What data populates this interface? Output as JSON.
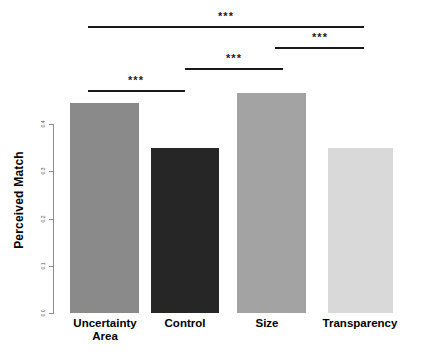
{
  "chart_data": {
    "type": "bar",
    "title": "",
    "xlabel": "",
    "ylabel": "Perceived Match",
    "categories": [
      "Uncertainty Area",
      "Control",
      "Size",
      "Transparency"
    ],
    "values": [
      0.445,
      0.35,
      0.466,
      0.35
    ],
    "ylim": [
      0.0,
      0.47
    ],
    "yticks": [
      "0.0",
      "0.1",
      "0.2",
      "0.3",
      "0.4"
    ],
    "ytick_values": [
      0.0,
      0.1,
      0.2,
      0.3,
      0.4
    ],
    "grid": false,
    "legend": "none",
    "bar_colors": [
      "#8a8a8a",
      "#262626",
      "#a3a3a3",
      "#d9d9d9"
    ],
    "annotations": [
      {
        "label": "***",
        "from": "Uncertainty Area",
        "to": "Transparency"
      },
      {
        "label": "***",
        "from": "Size",
        "to": "Transparency"
      },
      {
        "label": "***",
        "from": "Control",
        "to": "Size"
      },
      {
        "label": "***",
        "from": "Uncertainty Area",
        "to": "Control"
      }
    ]
  },
  "axis": {
    "y_title": "Perceived Match",
    "ticks": [
      {
        "label": "0.4"
      },
      {
        "label": "0.3"
      },
      {
        "label": "0.2"
      },
      {
        "label": "0.1"
      },
      {
        "label": "0.0"
      }
    ]
  },
  "categories": [
    {
      "line1": "Uncertainty",
      "line2": "Area"
    },
    {
      "line1": "Control",
      "line2": ""
    },
    {
      "line1": "Size",
      "line2": ""
    },
    {
      "line1": "Transparency",
      "line2": ""
    }
  ],
  "significance": [
    {
      "stars": "***"
    },
    {
      "stars": "***"
    },
    {
      "stars": "***"
    },
    {
      "stars": "***"
    }
  ]
}
